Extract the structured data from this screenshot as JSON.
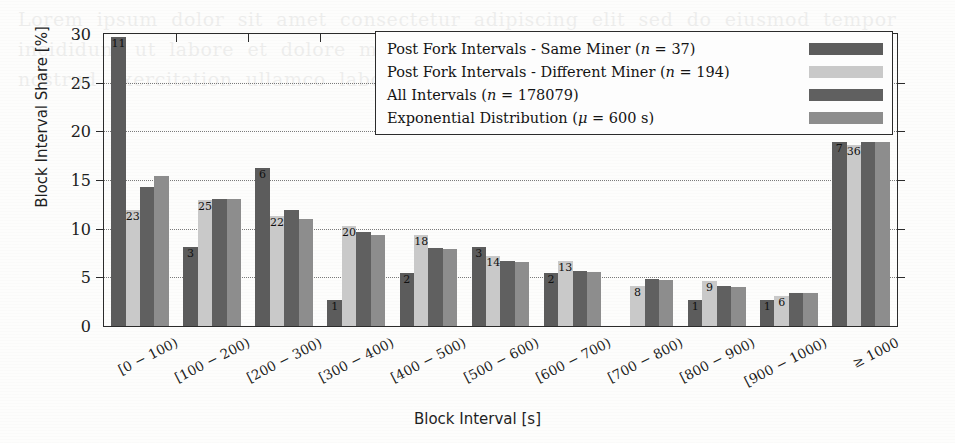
{
  "chart_data": {
    "type": "bar",
    "title": "",
    "xlabel": "Block Interval [s]",
    "ylabel": "Block Interval Share [%]",
    "ylim": [
      0,
      30
    ],
    "yticks": [
      0,
      5,
      10,
      15,
      20,
      25,
      30
    ],
    "grid": true,
    "legend_position": "top-right-inside",
    "categories": [
      "[0 − 100)",
      "[100 − 200)",
      "[200 − 300)",
      "[300 − 400)",
      "[400 − 500)",
      "[500 − 600)",
      "[600 − 700)",
      "[700 − 800)",
      "[800 − 900)",
      "[900 − 1000)",
      "≥ 1000"
    ],
    "series": [
      {
        "name": "Post Fork Intervals - Same Miner",
        "n": 37,
        "color": "#5c5c5c",
        "values": [
          29.7,
          8.1,
          16.2,
          2.7,
          5.4,
          8.1,
          5.4,
          0.0,
          2.7,
          2.7,
          18.9
        ],
        "counts": [
          11,
          3,
          6,
          1,
          2,
          3,
          2,
          0,
          1,
          1,
          7
        ]
      },
      {
        "name": "Post Fork Intervals - Different Miner",
        "n": 194,
        "color": "#c9c9c9",
        "values": [
          11.9,
          12.9,
          11.3,
          10.3,
          9.3,
          7.2,
          6.7,
          4.1,
          4.6,
          3.1,
          18.6
        ],
        "counts": [
          23,
          25,
          22,
          20,
          18,
          14,
          13,
          8,
          9,
          6,
          36
        ]
      },
      {
        "name": "All Intervals",
        "n": 178079,
        "color": "#606060",
        "values": [
          14.3,
          13.1,
          11.9,
          9.7,
          8.0,
          6.7,
          5.7,
          4.8,
          4.1,
          3.4,
          18.9
        ],
        "counts": []
      },
      {
        "name": "Exponential Distribution",
        "mu": "600 s",
        "color": "#8d8d8d",
        "values": [
          15.4,
          13.0,
          11.0,
          9.3,
          7.9,
          6.6,
          5.6,
          4.7,
          4.0,
          3.4,
          18.9
        ],
        "counts": []
      }
    ]
  },
  "legend": {
    "entries": [
      {
        "label": "Post Fork Intervals - Same Miner",
        "param": "(n = 37)",
        "param_sym": "n",
        "param_val": "37"
      },
      {
        "label": "Post Fork Intervals - Different Miner",
        "param": "(n = 194)",
        "param_sym": "n",
        "param_val": "194"
      },
      {
        "label": "All Intervals",
        "param": "(n = 178079)",
        "param_sym": "n",
        "param_val": "178079"
      },
      {
        "label": "Exponential Distribution",
        "param": "(μ = 600 s)",
        "param_sym": "μ",
        "param_val": "600 s"
      }
    ]
  },
  "background_text": "Lorem  ipsum  dolor  sit  amet  consectetur  adipiscing  elit  sed  do  eiusmod  tempor\nincididunt  ut  labore  et  dolore  magna  aliqua  ut  enim  ad  minim  veniam  quis\nnostrud  exercitation  ullamco  laboris  nisi  ut  aliquip  ex  ea  commodo  consequat"
}
